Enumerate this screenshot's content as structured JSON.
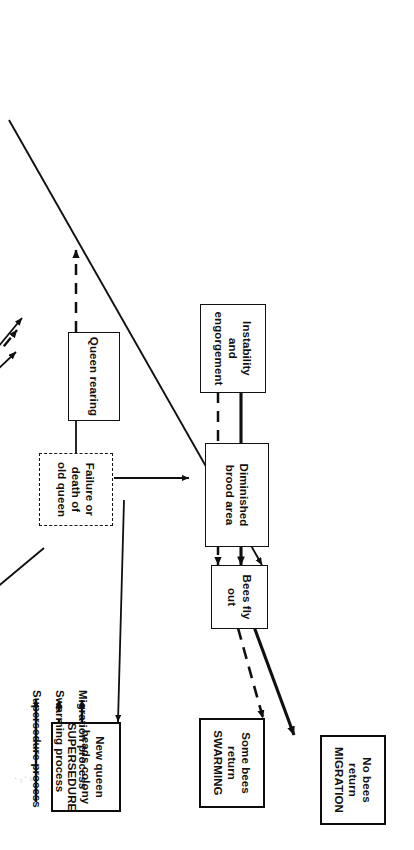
{
  "diagram": {
    "nodes": {
      "migration": {
        "lines": [
          "No bees",
          "return",
          "MIGRATION"
        ],
        "kind": "outcome"
      },
      "swarming": {
        "lines": [
          "Some bees",
          "return",
          "SWARMING"
        ],
        "kind": "outcome"
      },
      "supersedure": {
        "lines": [
          "New queen",
          "heads colony",
          "SUPERSEDURE"
        ],
        "kind": "outcome"
      },
      "bees_fly_out": {
        "lines": [
          "Bees fly",
          "out"
        ],
        "kind": "state"
      },
      "instability": {
        "lines": [
          "Instability",
          "and",
          "engorgement"
        ],
        "kind": "state"
      },
      "queen_rearing": {
        "lines": [
          "Queen rearing"
        ],
        "kind": "state"
      },
      "failure_queen": {
        "lines": [
          "Failure or",
          "death of",
          "old queen"
        ],
        "kind": "cause"
      },
      "colony_hindered": {
        "lines": [
          "Colony activities",
          "hindered"
        ],
        "kind": "state"
      },
      "unsatisfactory": {
        "lines": [
          "Unsatisfactory",
          "environmental",
          "c  ditim  n"
        ],
        "kind": "cause"
      },
      "diminished_brood": {
        "lines": [
          "Diminished",
          "brood area"
        ],
        "kind": "state"
      },
      "crowding": {
        "lines": [
          "Crowding"
        ],
        "kind": "state"
      },
      "small_nest": {
        "lines": [
          "Small",
          "nest",
          "cavity"
        ],
        "kind": "cause"
      }
    },
    "legend": {
      "items": [
        {
          "label": "Migration process",
          "style": "solid-thin"
        },
        {
          "label": "Swarming process",
          "style": "dashed"
        },
        {
          "label": "Supersedure process",
          "style": "solid-thick"
        }
      ]
    },
    "stray_mark": "·₃·₅·",
    "colors": {
      "ink": "#101010",
      "paper": "#ffffff"
    }
  }
}
